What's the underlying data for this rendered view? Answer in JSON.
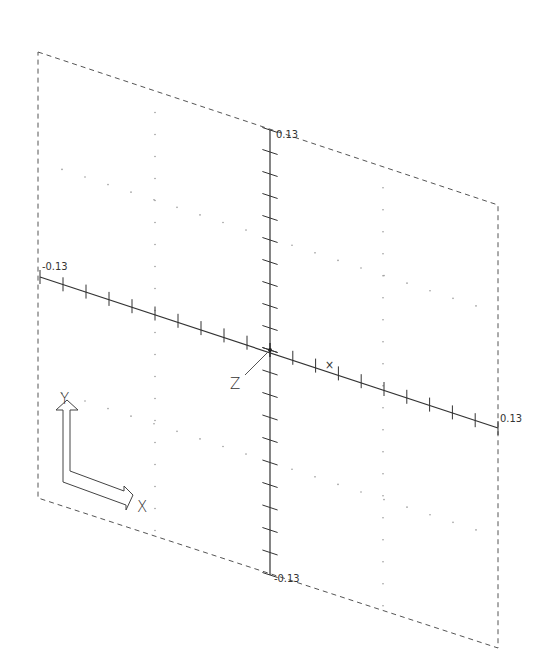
{
  "drawing": {
    "type": "cad-viewport",
    "projection": "oblique-isometric",
    "colors": {
      "background": "#ffffff",
      "line": "#333333",
      "frame": "#555555",
      "grid_dot": "#9a9a9a"
    },
    "frame": {
      "style": "dashed",
      "corners": [
        [
          38,
          52
        ],
        [
          498,
          205
        ],
        [
          498,
          648
        ],
        [
          38,
          498
        ]
      ]
    },
    "origin": [
      270,
      350
    ],
    "axes": {
      "x": {
        "start": [
          40,
          277
        ],
        "end": [
          498,
          428
        ],
        "ticks_per_side": 10,
        "min_label": "-0.13",
        "max_label": "0.13",
        "label_pos_min": [
          42,
          270
        ],
        "label_pos_max": [
          500,
          422
        ]
      },
      "y": {
        "start": [
          270,
          575
        ],
        "end": [
          270,
          130
        ],
        "ticks_per_side": 10,
        "max_label": "0.13",
        "min_label": "-0.13",
        "label_pos_max": [
          276,
          138
        ],
        "label_pos_min": [
          274,
          582
        ]
      }
    },
    "markers": {
      "x_cross": {
        "label": "×",
        "pos": [
          325,
          369
        ]
      },
      "z_label": "Z",
      "z_label_pos": [
        230,
        389
      ],
      "z_leader": [
        [
          245,
          375
        ],
        [
          268,
          352
        ]
      ]
    },
    "ucs_icon": {
      "y_label": "Y",
      "x_label": "X",
      "y_label_pos": [
        60,
        404
      ],
      "x_label_pos": [
        137,
        512
      ]
    },
    "labels": {
      "x_min": "-0.13",
      "x_max": "0.13",
      "y_max": "0.13",
      "y_min": "-0.13"
    }
  }
}
